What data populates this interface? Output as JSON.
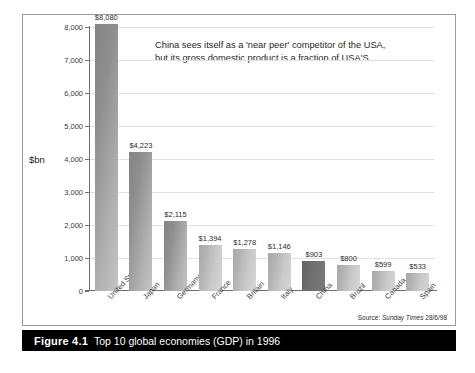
{
  "figure": {
    "caption_number": "Figure 4.1",
    "caption_title": "Top 10 global economies (GDP) in 1996",
    "source_prefix": "Source:",
    "source_publication": "Sunday Times",
    "source_date": "28/6/98"
  },
  "annotation": {
    "line1": "China sees itself as a 'near peer' competitor of the USA,",
    "line2": "but its gross domestic product is a fraction of USA'S"
  },
  "chart_data": {
    "type": "bar",
    "title": "Top 10 global economies (GDP) in 1996",
    "xlabel": "",
    "ylabel": "$bn",
    "ylim": [
      0,
      8000
    ],
    "yticks": [
      "0",
      "1,000",
      "2,000",
      "3,000",
      "4,000",
      "5,000",
      "6,000",
      "7,000",
      "8,000"
    ],
    "ytick_values": [
      0,
      1000,
      2000,
      3000,
      4000,
      5000,
      6000,
      7000,
      8000
    ],
    "grid": true,
    "legend": "none",
    "categories": [
      "United States",
      "Japan",
      "Germany",
      "France",
      "Britain",
      "Italy",
      "China",
      "Brazil",
      "Canada",
      "Spain"
    ],
    "values": [
      8080,
      4223,
      2115,
      1394,
      1278,
      1146,
      903,
      800,
      599,
      533
    ],
    "value_labels": [
      "$8,080",
      "$4,223",
      "$2,115",
      "$1,394",
      "$1,278",
      "$1,146",
      "$903",
      "$800",
      "$599",
      "$533"
    ],
    "highlight_category": "China",
    "colors": {
      "bar_light": "#c4c4c4",
      "bar_dark": "#8f8f8f",
      "bar_highlight": "#6e6e6e",
      "grid": "#e2e2e2",
      "axis": "#6f6f6f",
      "caption_bg": "#000000",
      "caption_fg": "#ffffff"
    }
  }
}
